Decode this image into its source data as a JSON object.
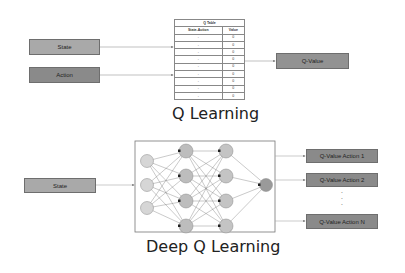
{
  "q_learning": {
    "title": "Q Learning",
    "inputs": [
      {
        "label": "State",
        "color": "#a9a9a9"
      },
      {
        "label": "Action",
        "color": "#8a8a8a"
      }
    ],
    "q_table": {
      "title": "Q Table",
      "headers": [
        "State-Action",
        "Value"
      ],
      "rows": [
        [
          "-",
          "0"
        ],
        [
          "-",
          "0"
        ],
        [
          "-",
          "0"
        ],
        [
          "-",
          "0"
        ],
        [
          "-",
          "0"
        ],
        [
          "-",
          "0"
        ],
        [
          "-",
          "0"
        ],
        [
          "-",
          "0"
        ],
        [
          "-",
          "0"
        ]
      ]
    },
    "output": {
      "label": "Q-Value",
      "color": "#929292"
    }
  },
  "deep_q_learning": {
    "title": "Deep Q Learning",
    "input": {
      "label": "State",
      "color": "#a9a9a9"
    },
    "network": {
      "layers": [
        3,
        4,
        4,
        1
      ]
    },
    "outputs": [
      {
        "label": "Q-Value Action 1"
      },
      {
        "label": "Q-Value Action 2"
      },
      {
        "label": "Q-Value Action N"
      }
    ],
    "ellipsis": ". . ."
  }
}
